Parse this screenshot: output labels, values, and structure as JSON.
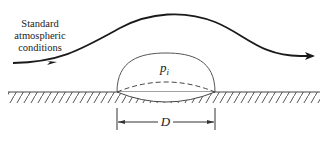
{
  "diagram": {
    "flow_label_lines": [
      "Standard",
      "atmospheric",
      "conditions"
    ],
    "internal_pressure_symbol": "p",
    "internal_pressure_subscript": "i",
    "dimension_label": "D",
    "colors": {
      "stroke": "#1a1a1a",
      "dome": "#555555",
      "hatch": "#555555",
      "background": "#ffffff"
    }
  }
}
